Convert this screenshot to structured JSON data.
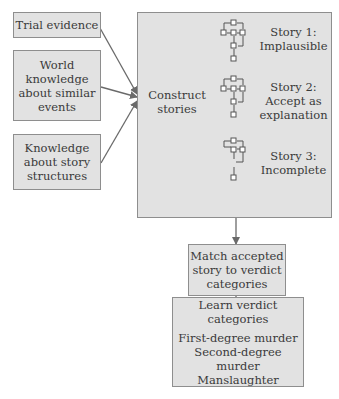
{
  "inputs": [
    {
      "label": "Trial evidence"
    },
    {
      "label": "World\nknowledge\nabout similar\nevents"
    },
    {
      "label": "Knowledge\nabout story\nstructures"
    }
  ],
  "construct": {
    "label": "Construct\nstories",
    "stories": [
      {
        "label": "Story 1:\nImplausible"
      },
      {
        "label": "Story 2:\nAccept as\nexplanation"
      },
      {
        "label": "Story 3:\nIncomplete"
      }
    ]
  },
  "match": {
    "label": "Match accepted\nstory to verdict\ncategories"
  },
  "learn": {
    "label": "Learn verdict\ncategories",
    "categories": [
      "First-degree murder",
      "Second-degree murder",
      "Manslaughter"
    ]
  },
  "colors": {
    "box_fill": "#e2e2e2",
    "border": "#8e8e8e",
    "arrow": "#6a6a6a"
  }
}
